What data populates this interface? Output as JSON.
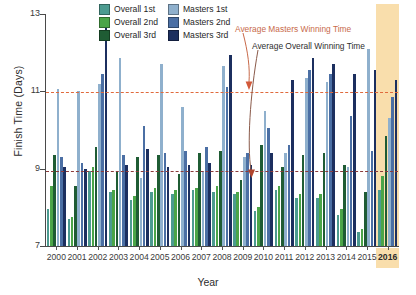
{
  "chart_data": {
    "type": "bar",
    "title": "",
    "xlabel": "Year",
    "ylabel": "Finish Time (Days)",
    "ylim": [
      7,
      13
    ],
    "yticks": [
      7,
      9,
      11,
      13
    ],
    "grid": false,
    "legend_position": "top-center",
    "categories": [
      "2000",
      "2001",
      "2002",
      "2003",
      "2004",
      "2005",
      "2006",
      "2007",
      "2008",
      "2009",
      "2010",
      "2011",
      "2012",
      "2013",
      "2014",
      "2015",
      "2016"
    ],
    "highlight_category": "2016",
    "highlight_color": "#f9deac",
    "series": [
      {
        "name": "Overall 1st",
        "color": "#4c9b90",
        "values": [
          7.95,
          7.7,
          8.95,
          8.4,
          8.2,
          8.4,
          8.35,
          8.45,
          8.4,
          8.35,
          7.9,
          8.45,
          8.25,
          8.25,
          7.8,
          7.35,
          8.45
        ]
      },
      {
        "name": "Overall 2nd",
        "color": "#4ba548",
        "values": [
          8.55,
          7.75,
          9.05,
          8.45,
          8.3,
          8.5,
          8.45,
          8.5,
          8.55,
          8.4,
          8.0,
          8.55,
          8.35,
          8.35,
          7.95,
          7.45,
          8.8
        ]
      },
      {
        "name": "Overall 3rd",
        "color": "#1f5c34",
        "values": [
          9.35,
          8.55,
          9.55,
          8.95,
          9.3,
          9.35,
          8.85,
          9.4,
          9.45,
          8.7,
          9.6,
          9.05,
          9.35,
          9.4,
          9.1,
          8.4,
          9.85
        ]
      },
      {
        "name": "Masters 1st",
        "color": "#8fb0cd",
        "values": [
          11.05,
          11.0,
          11.2,
          11.85,
          8.75,
          11.7,
          10.6,
          8.95,
          11.65,
          9.3,
          10.5,
          9.4,
          11.35,
          11.25,
          9.05,
          12.1,
          10.3
        ]
      },
      {
        "name": "Masters 2nd",
        "color": "#4b6fa4",
        "values": [
          9.3,
          9.15,
          11.45,
          9.35,
          10.1,
          9.4,
          9.45,
          9.55,
          11.1,
          9.4,
          10.05,
          9.6,
          11.55,
          11.45,
          10.35,
          9.45,
          10.85
        ]
      },
      {
        "name": "Masters 3rd",
        "color": "#1c2f5f",
        "values": [
          9.05,
          9.0,
          12.85,
          9.1,
          9.5,
          9.05,
          9.1,
          9.15,
          11.95,
          9.1,
          9.4,
          11.3,
          11.85,
          11.7,
          11.45,
          11.55,
          11.3
        ]
      }
    ],
    "reference_lines": [
      {
        "name": "Average Masters Winning Time",
        "value": 10.98,
        "color": "#e06a3c",
        "style": "dashed"
      },
      {
        "name": "Average Overall Winning Time",
        "value": 8.93,
        "color": "#8b3b3b",
        "style": "dashed"
      }
    ],
    "annotations": [
      {
        "name": "Average Masters Winning Time",
        "color": "#c86a4a"
      },
      {
        "name": "Average Overall Winning Time",
        "color": "#2e2e2e"
      }
    ]
  },
  "legend": {
    "columns": [
      {
        "entries": [
          {
            "label": "Overall 1st",
            "color": "#4c9b90"
          },
          {
            "label": "Overall 2nd",
            "color": "#4ba548"
          },
          {
            "label": "Overall 3rd",
            "color": "#1f5c34"
          }
        ]
      },
      {
        "entries": [
          {
            "label": "Masters 1st",
            "color": "#8fb0cd"
          },
          {
            "label": "Masters 2nd",
            "color": "#4b6fa4"
          },
          {
            "label": "Masters 3rd",
            "color": "#1c2f5f"
          }
        ]
      }
    ]
  }
}
